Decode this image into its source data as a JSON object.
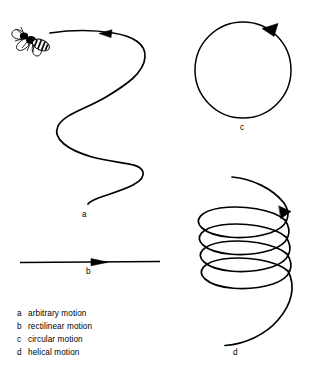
{
  "figure": {
    "background_color": "#ffffff",
    "ink_color": "#000000",
    "width": 310,
    "height": 377,
    "paths": {
      "a": {
        "label": "a",
        "icon": "fly-insect-icon",
        "shape": "wavy-s-curve",
        "arrow_direction": "left",
        "stroke_width": 1.7
      },
      "b": {
        "label": "b",
        "shape": "straight-line",
        "arrow_direction": "right",
        "stroke_width": 1.4
      },
      "c": {
        "label": "c",
        "shape": "circle",
        "arrow_direction": "clockwise",
        "stroke_width": 1.5
      },
      "d": {
        "label": "d",
        "shape": "helix",
        "loops": 4,
        "arrow_direction": "clockwise-descending",
        "stroke_width": 1.7
      }
    }
  },
  "legend": {
    "items": [
      {
        "key": "a",
        "text": "arbitrary motion"
      },
      {
        "key": "b",
        "text": "rectilinear motion"
      },
      {
        "key": "c",
        "text": "circular motion"
      },
      {
        "key": "d",
        "text": "helical motion"
      }
    ]
  }
}
